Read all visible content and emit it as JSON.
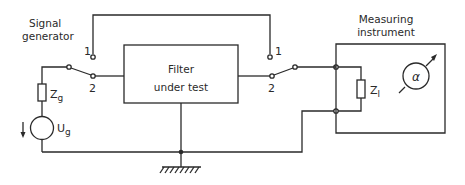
{
  "diagram": {
    "labels": {
      "signal_generator_line1": "Signal",
      "signal_generator_line2": "generator",
      "measuring_instrument_line1": "Measuring",
      "measuring_instrument_line2": "instrument",
      "filter_line1": "Filter",
      "filter_line2": "under test",
      "zg_main": "Z",
      "zg_sub": "g",
      "ug_main": "U",
      "ug_sub": "g",
      "zl_main": "Z",
      "zl_sub": "l",
      "meter_symbol": "α",
      "left_switch_pos1": "1",
      "left_switch_pos2": "2",
      "right_switch_pos1": "1",
      "right_switch_pos2": "2"
    },
    "components": [
      {
        "id": "signal-generator",
        "type": "voltage-source",
        "label": "Ug"
      },
      {
        "id": "generator-impedance",
        "type": "resistor",
        "label": "Zg"
      },
      {
        "id": "left-switch",
        "type": "spdt-switch",
        "positions": [
          "1",
          "2"
        ],
        "selected": "2"
      },
      {
        "id": "filter-under-test",
        "type": "block",
        "label": "Filter under test"
      },
      {
        "id": "right-switch",
        "type": "spdt-switch",
        "positions": [
          "1",
          "2"
        ],
        "selected": "2"
      },
      {
        "id": "load-impedance",
        "type": "resistor",
        "label": "Zl"
      },
      {
        "id": "meter",
        "type": "meter",
        "label": "α"
      },
      {
        "id": "ground",
        "type": "ground"
      }
    ]
  }
}
